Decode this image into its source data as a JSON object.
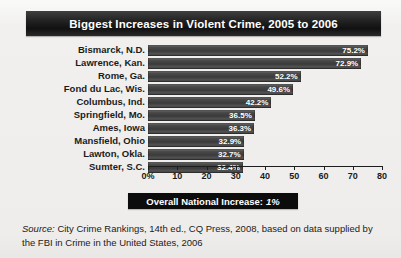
{
  "title": "Biggest Increases in Violent Crime, 2005 to 2006",
  "callout": {
    "label": "Overall National Increase:",
    "value": "1%"
  },
  "source": {
    "label": "Source:",
    "text": " City Crime Rankings, 14th ed., CQ Press, 2008, based on data supplied by the FBI in Crime in the United States, 2006"
  },
  "colors": {
    "bar": "#4a4a4a",
    "banner": "#1a1a1a",
    "background": "#f1f0ee",
    "text": "#1b1b1b"
  },
  "chart_data": {
    "type": "bar",
    "orientation": "horizontal",
    "title": "Biggest Increases in Violent Crime, 2005 to 2006",
    "xlabel": "",
    "ylabel": "",
    "xlim": [
      0,
      80
    ],
    "grid": false,
    "legend": null,
    "categories": [
      "Bismarck, N.D.",
      "Lawrence, Kan.",
      "Rome, Ga.",
      "Fond du Lac, Wis.",
      "Columbus, Ind.",
      "Springfield, Mo.",
      "Ames, Iowa",
      "Mansfield, Ohio",
      "Lawton, Okla.",
      "Sumter, S.C."
    ],
    "values": [
      75.2,
      72.9,
      52.2,
      49.6,
      42.2,
      36.5,
      36.3,
      32.9,
      32.7,
      32.4
    ],
    "value_labels": [
      "75.2%",
      "72.9%",
      "52.2%",
      "49.6%",
      "42.2%",
      "36.5%",
      "36.3%",
      "32.9%",
      "32.7%",
      "32.4%"
    ],
    "tick_values": [
      0,
      10,
      20,
      30,
      40,
      50,
      60,
      70,
      80
    ],
    "tick_labels": [
      "0%",
      "10",
      "20",
      "30",
      "40",
      "50",
      "60",
      "70",
      "80"
    ],
    "annotations": [
      "Overall National Increase: 1%"
    ]
  }
}
